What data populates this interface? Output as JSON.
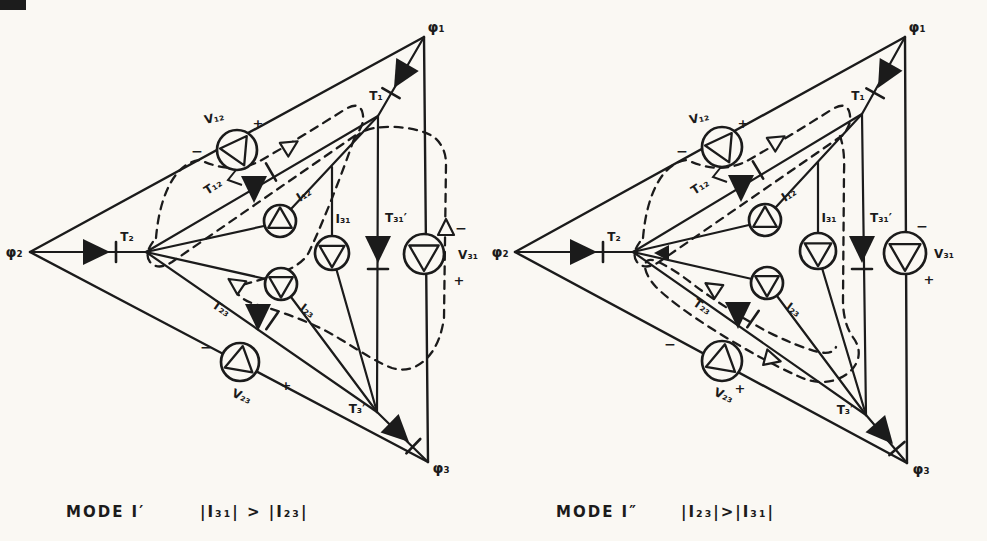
{
  "page": {
    "kind": "hand-drawn power-converter mode diagram",
    "paper_color": "#faf8f3",
    "ink_color": "#1b1b1b"
  },
  "diagrams": [
    {
      "id": "mode-i-prime",
      "caption": {
        "mode": "MODE I′",
        "condition": "|I₃₁| > |I₂₃|"
      },
      "labels": {
        "phi1": "φ₁",
        "phi2": "φ₂",
        "phi3": "φ₃",
        "t1": "T₁",
        "t2": "T₂",
        "t3p": "T₃′",
        "t12": "T₁₂",
        "t23": "T₂₃",
        "t31p": "T₃₁′",
        "v12": "V₁₂",
        "v23": "V₂₃",
        "v31": "V₃₁",
        "i12": "I₁₂",
        "i31": "I₃₁",
        "i23": "I₂₃",
        "v12_neg": "−",
        "v12_pos": "+",
        "v23_neg": "−",
        "v23_pos": "+",
        "v31_neg": "−",
        "v31_pos": "+"
      }
    },
    {
      "id": "mode-i-double-prime",
      "caption": {
        "mode": "MODE I″",
        "condition": "|I₂₃|>|I₃₁|"
      },
      "labels": {
        "phi1": "φ₁",
        "phi2": "φ₂",
        "phi3": "φ₃",
        "t1": "T₁",
        "t2": "T₂",
        "t3p": "T₃′",
        "t12": "T₁₂",
        "t23": "T₂₃",
        "t31p": "T₃₁′",
        "v12": "V₁₂",
        "v23": "V₂₃",
        "v31": "V₃₁",
        "i12": "I₁₂",
        "i31": "I₃₁",
        "i23": "I₂₃",
        "v12_neg": "−",
        "v12_pos": "+",
        "v23_neg": "−",
        "v23_pos": "+",
        "v31_neg": "−",
        "v31_pos": "+"
      }
    }
  ]
}
